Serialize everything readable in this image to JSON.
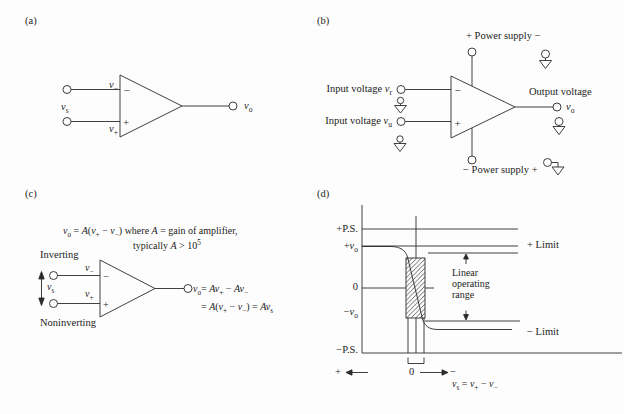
{
  "panels": {
    "a": {
      "tag": "(a)",
      "v_minus": "*v*_{−}",
      "v_plus": "*v*_{+}",
      "v_s": "*v*_{s}",
      "v_o": "*v*_{o}",
      "minus_sign": "−",
      "plus_sign": "+"
    },
    "b": {
      "tag": "(b)",
      "top_supply": "+ Power supply −",
      "bottom_supply": "− Power supply +",
      "input1": "Input voltage *v*_{r}",
      "input2": "Input voltage *v*_{u}",
      "output_label": "Output voltage",
      "v_o": "*v*_{o}",
      "minus_sign": "−",
      "plus_sign": "+"
    },
    "c": {
      "tag": "(c)",
      "eq_line1": "*v*_{o} = *A*(*v*_{+} − *v*_{−}) where *A* = gain of amplifier,",
      "eq_line2": "typically *A* > 10^{5}",
      "inverting": "Inverting",
      "noninverting": "Noninverting",
      "v_minus": "*v*_{−}",
      "v_plus": "*v*_{+}",
      "v_s": "*v*_{s}",
      "out_eq1": "*v*_{o}= *Av*_{+} − *Av*_{−}",
      "out_eq2": "= *A*(*v*_{+} − *v*_{−}) = *Av*_{s}",
      "minus_sign": "−",
      "plus_sign": "+"
    },
    "d": {
      "tag": "(d)",
      "y_pps": "+P.S.",
      "y_pvo": "+*v*_{o}",
      "y_zero": "0",
      "y_nvo": "−*v*_{o}",
      "y_nps": "−P.S.",
      "plus_limit": "+ Limit",
      "minus_limit": "− Limit",
      "linear_1": "Linear",
      "linear_2": "operating",
      "linear_3": "range",
      "x_plus": "+",
      "x_zero": "0",
      "x_minus": "−",
      "x_eq": "*v*_{s} = *v*_{+} − *v*_{−}"
    }
  }
}
